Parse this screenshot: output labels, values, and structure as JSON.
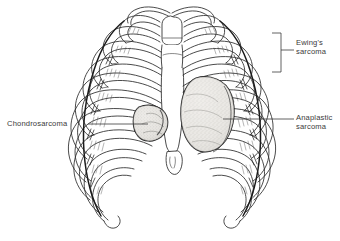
{
  "figure": {
    "view": "anterior",
    "background_color": "#ffffff",
    "ink_color": "#1f1f1f",
    "text_color": "#3a3a3a",
    "mass_fill_color": "#e8e6e2",
    "mass_stipple_color": "#9a9a96",
    "shading_color": "#555555"
  },
  "labels": {
    "chondrosarcoma": {
      "text": "Chondrosarcoma",
      "side": "left",
      "leader": "horizontal-line",
      "points_to": "left-anterior-rib-mass"
    },
    "anaplastic": {
      "text": "Anaplastic\nsarcoma",
      "side": "right",
      "leader": "horizontal-line",
      "points_to": "central-mediastinal-mass"
    },
    "ewings": {
      "text": "Ewing's\nsarcoma",
      "side": "right",
      "leader": "bracket",
      "points_to": "right-posterolateral-ribs"
    }
  },
  "anatomy": {
    "parts": [
      "clavicle-left",
      "clavicle-right",
      "sternum-manubrium",
      "sternum-body",
      "xiphoid-process",
      "ribs-left",
      "ribs-right",
      "costal-cartilage",
      "costal-margin"
    ],
    "rib_pairs": 10
  },
  "masses": [
    {
      "name": "chondrosarcoma-mass",
      "location": "left-fifth-rib-anterior"
    },
    {
      "name": "anaplastic-sarcoma-mass",
      "location": "central-mediastinum"
    }
  ]
}
